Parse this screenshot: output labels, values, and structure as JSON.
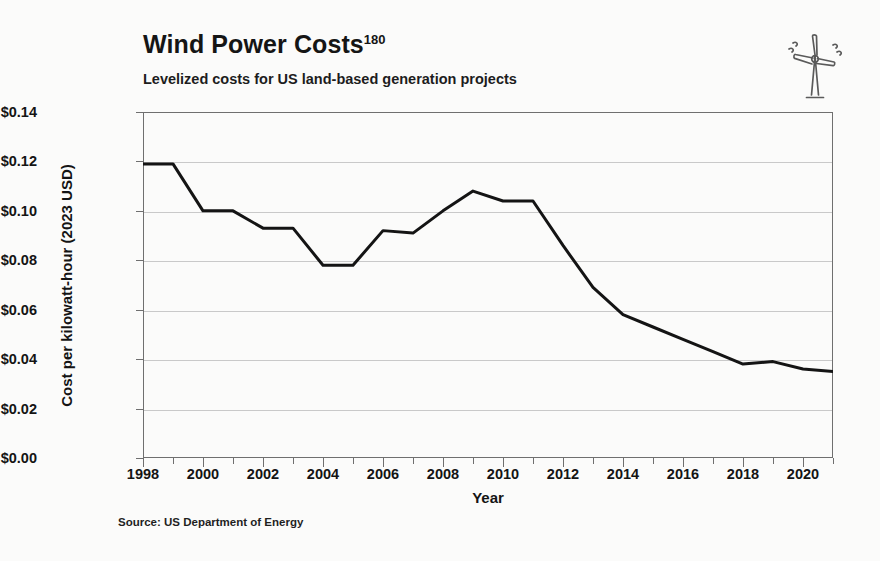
{
  "header": {
    "title": "Wind Power Costs",
    "title_superscript": "180",
    "subtitle": "Levelized costs for US land-based generation projects",
    "icon": "wind-turbine-icon"
  },
  "source_note": "Source: US Department of Energy",
  "colors": {
    "line": "#141414",
    "grid": "#c9c9c9",
    "frame": "#6f6f6f",
    "text": "#141414",
    "background": "#fbfbfa"
  },
  "chart_data": {
    "type": "line",
    "title": "Wind Power Costs",
    "subtitle": "Levelized costs for US land-based generation projects",
    "xlabel": "Year",
    "ylabel": "Cost per kilowatt-hour (2023 USD)",
    "xlim": [
      1998,
      2021
    ],
    "ylim": [
      0.0,
      0.14
    ],
    "grid": "horizontal",
    "legend": "none",
    "x": [
      1998,
      1999,
      2000,
      2001,
      2002,
      2003,
      2004,
      2005,
      2006,
      2007,
      2008,
      2009,
      2010,
      2011,
      2012,
      2013,
      2014,
      2015,
      2016,
      2017,
      2018,
      2019,
      2020,
      2021
    ],
    "values": [
      0.119,
      0.119,
      0.1,
      0.1,
      0.093,
      0.093,
      0.078,
      0.078,
      0.092,
      0.091,
      0.1,
      0.108,
      0.104,
      0.104,
      0.086,
      0.069,
      0.058,
      0.053,
      0.048,
      0.043,
      0.038,
      0.039,
      0.036,
      0.035
    ],
    "yticks": [
      0.0,
      0.02,
      0.04,
      0.06,
      0.08,
      0.1,
      0.12,
      0.14
    ],
    "ytick_labels": [
      "$0.00",
      "$0.02",
      "$0.04",
      "$0.06",
      "$0.08",
      "$0.10",
      "$0.12",
      "$0.14"
    ],
    "xticks": [
      1998,
      2000,
      2002,
      2004,
      2006,
      2008,
      2010,
      2012,
      2014,
      2016,
      2018,
      2020
    ],
    "xtick_labels": [
      "1998",
      "2000",
      "2002",
      "2004",
      "2006",
      "2008",
      "2010",
      "2012",
      "2014",
      "2016",
      "2018",
      "2020"
    ],
    "xminor_step": 1,
    "source": "US Department of Energy",
    "units": "2023 USD per kilowatt-hour"
  }
}
